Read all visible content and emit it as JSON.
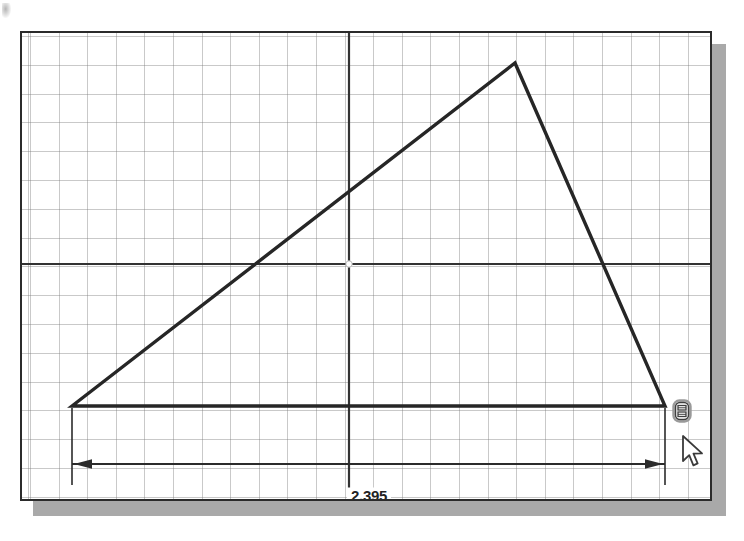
{
  "app": {
    "title": "Sketch Dimension View",
    "mode": "2D Sketch"
  },
  "canvas": {
    "name": "sketch-canvas",
    "background_color": "#ffffff",
    "border_color": "#2b2b2b",
    "shadow_color": "#a9a9a9",
    "grid": {
      "visible": true,
      "color": "#787878",
      "spacing_px": 28.6,
      "style": "dotted"
    },
    "axes": {
      "visible": true,
      "color": "#333333",
      "origin_marker": "crosshair",
      "origin_x": 327,
      "origin_y": 231
    }
  },
  "geometry": {
    "name": "closed-triangle-profile",
    "color": "#262626",
    "line_weight": 3,
    "vertices": [
      {
        "label": "bottom-left",
        "x": 50,
        "y": 373
      },
      {
        "label": "apex",
        "x": 493,
        "y": 30
      },
      {
        "label": "bottom-right",
        "x": 643,
        "y": 373
      }
    ],
    "closed": true
  },
  "dimension": {
    "name": "horizontal-linear-dimension",
    "value": "2.395",
    "units": "in",
    "color": "#2b2b2b",
    "dimension_line_y": 431,
    "extension_left_x": 50,
    "extension_right_x": 643,
    "arrow_style": "filled-closed",
    "arrow_direction": "outward"
  },
  "cursor": {
    "name": "mouse-pointer",
    "icon": "arrow-pointer-icon",
    "x": 659,
    "y": 402,
    "fill": "#ffffff",
    "stroke": "#3a3a3a"
  },
  "snap_indicator": {
    "name": "constraint-snap-glyph",
    "icon": "coincident-endpoint-icon",
    "x": 648,
    "y": 364,
    "stroke": "#3f3f3f",
    "tooltip": "Coincident"
  }
}
